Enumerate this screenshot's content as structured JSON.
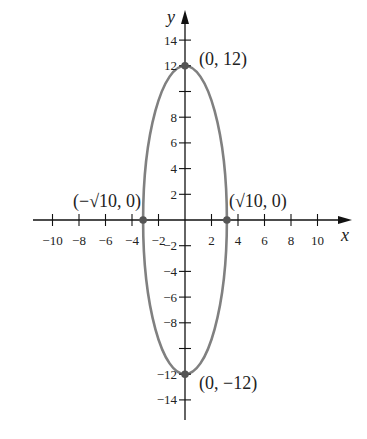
{
  "chart_data": {
    "type": "line",
    "title": "",
    "xlabel": "x",
    "ylabel": "y",
    "xlim": [
      -11,
      12
    ],
    "ylim": [
      -15,
      15
    ],
    "grid": false,
    "x_ticks": [
      -10,
      -8,
      -6,
      -4,
      -2,
      2,
      4,
      6,
      8,
      10
    ],
    "x_tick_labels": [
      "−10",
      "−8",
      "−6",
      "−4",
      "−2",
      "2",
      "4",
      "6",
      "8",
      "10"
    ],
    "y_ticks": [
      14,
      12,
      10,
      8,
      6,
      4,
      2,
      -2,
      -4,
      -6,
      -8,
      -10,
      -12,
      -14
    ],
    "y_tick_labels": [
      "14",
      "12",
      "",
      "8",
      "6",
      "4",
      "2",
      "−2",
      "−4",
      "−6",
      "−8",
      "",
      "−12",
      "−14"
    ],
    "series": [
      {
        "name": "ellipse",
        "shape": "ellipse",
        "center": [
          0,
          0
        ],
        "semi_x": 3.1623,
        "semi_y": 12,
        "color": "#808080"
      }
    ],
    "points": [
      {
        "x": 0,
        "y": 12,
        "label": "(0, 12)"
      },
      {
        "x": 0,
        "y": -12,
        "label": "(0, −12)"
      },
      {
        "x": -3.1623,
        "y": 0,
        "label": "(−√10, 0)"
      },
      {
        "x": 3.1623,
        "y": 0,
        "label": "(√10, 0)"
      }
    ]
  },
  "layout": {
    "origin_px": [
      185,
      220
    ],
    "x_scale": 13.25,
    "y_scale": 12.85,
    "axis_color": "#111111",
    "curve_color": "#808080",
    "point_color": "#555555"
  }
}
